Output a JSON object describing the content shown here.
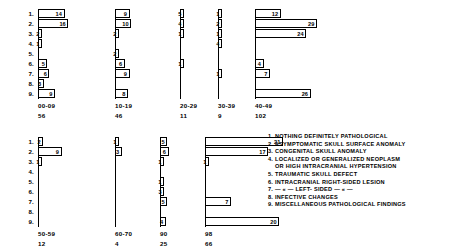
{
  "figure": {
    "row_labels": [
      "1.",
      "2.",
      "3.",
      "4.",
      "5.",
      "6.",
      "7.",
      "8.",
      "9."
    ],
    "legend": [
      "1. NOTHING  DEFINITELY  PATHOLOGICAL",
      "2. ASYMPTOMATIC  SKULL  SURFACE  ANOMALY",
      "3. CONGENITAL  SKULL  ANOMALY",
      "4. LOCALIZED  OR  GENERALIZED  NEOPLASM",
      "OR HIGH INTRACRANIAL HYPERTENSION",
      "5. TRAUMATIC  SKULL  DEFECT",
      "6. INTRACRANIAL  RIGHT-SIDED  LESION",
      "7.   — « —          LEFT- SIDED   — « —",
      "8. INFECTIVE  CHANGES",
      "9. MISCELLANEOUS  PATHOLOGICAL  FINDINGS"
    ]
  },
  "chart_data": {
    "type": "bar",
    "title": "",
    "xlabel": "",
    "ylabel": "",
    "orientation": "horizontal",
    "grid": false,
    "legend_position": "right",
    "categories": [
      "1.",
      "2.",
      "3.",
      "4.",
      "5.",
      "6.",
      "7.",
      "8.",
      "9."
    ],
    "category_labels": [
      "NOTHING DEFINITELY PATHOLOGICAL",
      "ASYMPTOMATIC SKULL SURFACE ANOMALY",
      "CONGENITAL SKULL ANOMALY",
      "LOCALIZED OR GENERALIZED NEOPLASM OR HIGH INTRACRANIAL HYPERTENSION",
      "TRAUMATIC SKULL DEFECT",
      "INTRACRANIAL RIGHT-SIDED LESION",
      "INTRACRANIAL LEFT-SIDED LESION",
      "INFECTIVE CHANGES",
      "MISCELLANEOUS PATHOLOGICAL FINDINGS"
    ],
    "panels": [
      {
        "group": "00-09",
        "total": "56",
        "values": [
          14,
          16,
          2,
          1,
          0,
          5,
          6,
          3,
          9
        ],
        "row": "top"
      },
      {
        "group": "10-19",
        "total": "46",
        "values": [
          9,
          10,
          2,
          0,
          2,
          6,
          9,
          0,
          8
        ],
        "row": "top"
      },
      {
        "group": "20-29",
        "total": "11",
        "values": [
          5,
          4,
          1,
          0,
          0,
          1,
          0,
          0,
          0
        ],
        "row": "top"
      },
      {
        "group": "30-39",
        "total": "9",
        "values": [
          1,
          2,
          1,
          4,
          0,
          0,
          1,
          0,
          0
        ],
        "row": "top"
      },
      {
        "group": "40-49",
        "total": "102",
        "values": [
          12,
          29,
          24,
          0,
          0,
          4,
          7,
          0,
          26
        ],
        "row": "top"
      },
      {
        "group": "50-59",
        "total": "12",
        "values": [
          2,
          9,
          1,
          0,
          0,
          0,
          0,
          0,
          0
        ],
        "row": "bottom"
      },
      {
        "group": "60-70",
        "total": "4",
        "values": [
          1,
          3,
          0,
          0,
          0,
          0,
          0,
          0,
          0
        ],
        "row": "bottom"
      },
      {
        "group": "90",
        "total": "25",
        "values": [
          5,
          6,
          1,
          0,
          1,
          3,
          5,
          0,
          4
        ],
        "row": "bottom"
      },
      {
        "group": "98",
        "total": "66",
        "values": [
          21,
          17,
          1,
          0,
          0,
          0,
          7,
          0,
          20
        ],
        "row": "bottom"
      }
    ]
  },
  "layout": {
    "panels_top": [
      {
        "left": 38,
        "width": 55,
        "max": 29
      },
      {
        "left": 115,
        "width": 47,
        "max": 29
      },
      {
        "left": 180,
        "width": 22,
        "max": 29
      },
      {
        "left": 218,
        "width": 22,
        "max": 29
      },
      {
        "left": 255,
        "width": 62,
        "max": 29
      }
    ],
    "panels_bottom": [
      {
        "left": 38,
        "width": 55,
        "max": 21
      },
      {
        "left": 115,
        "width": 47,
        "max": 21
      },
      {
        "left": 160,
        "width": 30,
        "max": 21
      },
      {
        "left": 205,
        "width": 78,
        "max": 21
      }
    ]
  }
}
